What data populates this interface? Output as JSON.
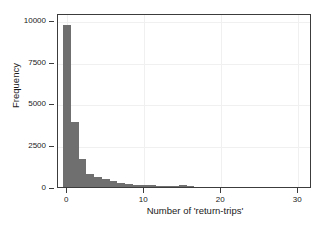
{
  "chart_data": {
    "type": "bar",
    "title": "",
    "subtitle": "",
    "xlabel": "Number of 'return-trips'",
    "ylabel": "Frequency",
    "xlim": [
      -1.2,
      31.8
    ],
    "ylim": [
      0,
      10400
    ],
    "grid": true,
    "grid_color": "#f0f0f0",
    "bar_color": "#6f6f6f",
    "legend": null,
    "legend_position": "none",
    "bin_width": 1,
    "xticks": [
      0,
      10,
      20,
      30
    ],
    "xtick_labels": [
      "0",
      "10",
      "20",
      "30"
    ],
    "yticks": [
      0,
      2500,
      5000,
      7500,
      10000
    ],
    "ytick_labels": [
      "0",
      "2500",
      "5000",
      "7500",
      "10000"
    ],
    "categories": [
      0,
      1,
      2,
      3,
      4,
      5,
      6,
      7,
      8,
      9,
      10,
      11,
      12,
      13,
      14,
      15,
      16,
      17,
      18,
      19,
      20,
      21,
      22,
      23,
      24,
      25,
      26,
      27,
      28,
      29,
      30,
      31
    ],
    "values": [
      9700,
      3900,
      1650,
      800,
      620,
      450,
      330,
      250,
      190,
      150,
      120,
      100,
      85,
      70,
      60,
      130,
      45,
      30,
      25,
      20,
      18,
      15,
      12,
      10,
      8,
      7,
      6,
      5,
      4,
      3,
      2,
      2
    ],
    "annotations": []
  },
  "axes": {
    "y_title": "Frequency",
    "x_title": "Number of 'return-trips'"
  }
}
